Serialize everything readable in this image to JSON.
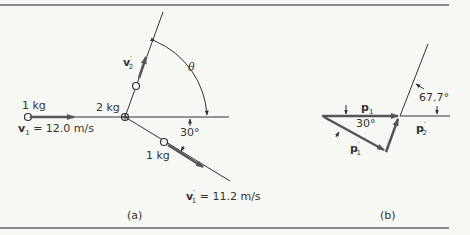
{
  "figure": {
    "panel_a": {
      "caption": "(a)",
      "incoming_mass": "1 kg",
      "incoming_velocity_symbol": "v",
      "incoming_velocity_sub": "1",
      "incoming_velocity_value": " = 12.0 m/s",
      "target_mass": "2 kg",
      "target_velocity_symbol": "v",
      "target_velocity_sup": "′",
      "target_velocity_sub": "2",
      "angle_theta": "θ",
      "deflection_angle": "30°",
      "outgoing_mass": "1 kg",
      "outgoing_velocity_symbol": "v",
      "outgoing_velocity_sup": "′",
      "outgoing_velocity_sub": "1",
      "outgoing_velocity_value": " = 11.2 m/s"
    },
    "panel_b": {
      "caption": "(b)",
      "p1_symbol": "p",
      "p1_sub": "1",
      "p1_prime_symbol": "p",
      "p1_prime_sup": "′",
      "p1_prime_sub": "1",
      "p2_prime_symbol": "p",
      "p2_prime_sup": "′",
      "p2_prime_sub": "2",
      "angle_30": "30°",
      "angle_67": "67.7°"
    },
    "colors": {
      "line": "#333333",
      "arrow": "#555555",
      "rule": "#666666",
      "background": "#f7f7f4"
    }
  }
}
